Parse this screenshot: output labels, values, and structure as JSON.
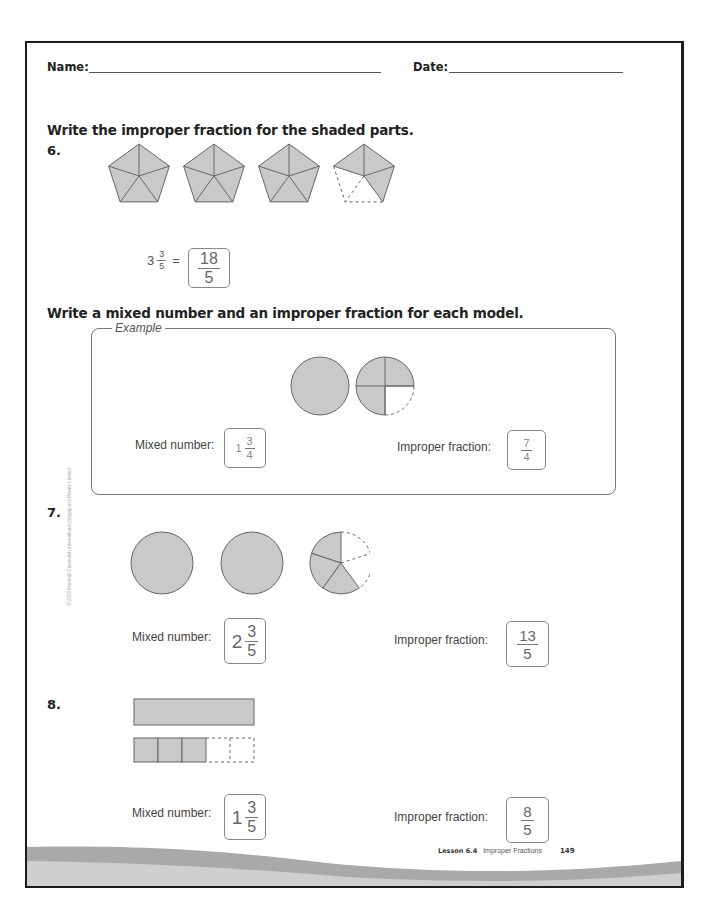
{
  "header": {
    "name_label": "Name:",
    "date_label": "Date:"
  },
  "section1": {
    "instruction": "Write the improper fraction for the shaded parts.",
    "question": {
      "number": "6.",
      "model": "pentagons",
      "parts_per_whole": 5,
      "shaded_parts": [
        5,
        5,
        5,
        3
      ],
      "equation_prefix": {
        "whole": "3",
        "numerator": "3",
        "denominator": "5",
        "equals": "="
      },
      "answer": {
        "numerator": "18",
        "denominator": "5"
      }
    }
  },
  "section2": {
    "instruction": "Write a mixed number and an improper fraction for each model.",
    "example": {
      "title": "Example",
      "model": "circles",
      "parts_per_whole": 4,
      "shaded_parts": [
        4,
        3
      ],
      "mixed_label": "Mixed number:",
      "mixed": {
        "whole": "1",
        "numerator": "3",
        "denominator": "4"
      },
      "improper_label": "Improper fraction:",
      "improper": {
        "numerator": "7",
        "denominator": "4"
      }
    },
    "questions": [
      {
        "number": "7.",
        "model": "circles",
        "parts_per_whole": 5,
        "shaded_parts": [
          5,
          5,
          3
        ],
        "mixed_label": "Mixed number:",
        "mixed": {
          "whole": "2",
          "numerator": "3",
          "denominator": "5"
        },
        "improper_label": "Improper fraction:",
        "improper": {
          "numerator": "13",
          "denominator": "5"
        }
      },
      {
        "number": "8.",
        "model": "bars",
        "parts_per_whole": 5,
        "shaded_parts": [
          5,
          3
        ],
        "mixed_label": "Mixed number:",
        "mixed": {
          "whole": "1",
          "numerator": "3",
          "denominator": "5"
        },
        "improper_label": "Improper fraction:",
        "improper": {
          "numerator": "8",
          "denominator": "5"
        }
      }
    ]
  },
  "sidebar": {
    "copyright": "© 2009 Marshall Cavendish International (Singapore) Private Limited"
  },
  "footer": {
    "lesson": "Lesson 6.4",
    "topic": "Improper Fractions",
    "page_number": "149"
  },
  "colors": {
    "shade": "#c9c9c9",
    "outline": "#666666",
    "wave_dark": "#a9a9a9",
    "wave_light": "#cfcfcf",
    "border": "#1c1c1c"
  }
}
